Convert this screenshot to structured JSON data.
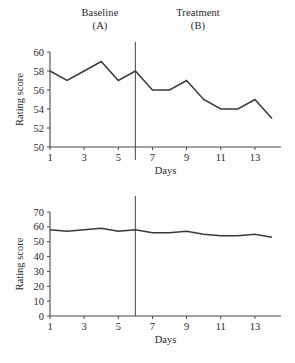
{
  "phases": [
    {
      "name": "Baseline",
      "code": "(A)"
    },
    {
      "name": "Treatment",
      "code": "(B)"
    }
  ],
  "chart_data": [
    {
      "type": "line",
      "panel": "top",
      "title": "",
      "xlabel": "Days",
      "ylabel": "Rating score",
      "x": [
        1,
        2,
        3,
        4,
        5,
        6,
        7,
        8,
        9,
        10,
        11,
        12,
        13,
        14
      ],
      "values": [
        58,
        57,
        58,
        59,
        57,
        58,
        56,
        56,
        57,
        55,
        54,
        54,
        55,
        53
      ],
      "xticks": [
        1,
        3,
        5,
        7,
        9,
        11,
        13
      ],
      "yticks": [
        50,
        52,
        54,
        56,
        58,
        60
      ],
      "xlim": [
        1,
        14
      ],
      "ylim": [
        50,
        60
      ],
      "grid": false,
      "legend": "none",
      "phase_divider_x": 6,
      "series": [
        {
          "name": "Rating score",
          "values": [
            58,
            57,
            58,
            59,
            57,
            58,
            56,
            56,
            57,
            55,
            54,
            54,
            55,
            53
          ]
        }
      ]
    },
    {
      "type": "line",
      "panel": "bottom",
      "title": "",
      "xlabel": "Days",
      "ylabel": "Rating score",
      "x": [
        1,
        2,
        3,
        4,
        5,
        6,
        7,
        8,
        9,
        10,
        11,
        12,
        13,
        14
      ],
      "values": [
        58,
        57,
        58,
        59,
        57,
        58,
        56,
        56,
        57,
        55,
        54,
        54,
        55,
        53
      ],
      "xticks": [
        1,
        3,
        5,
        7,
        9,
        11,
        13
      ],
      "yticks": [
        0,
        10,
        20,
        30,
        40,
        50,
        60,
        70
      ],
      "xlim": [
        1,
        14
      ],
      "ylim": [
        0,
        70
      ],
      "grid": false,
      "legend": "none",
      "phase_divider_x": 6,
      "series": [
        {
          "name": "Rating score",
          "values": [
            58,
            57,
            58,
            59,
            57,
            58,
            56,
            56,
            57,
            55,
            54,
            54,
            55,
            53
          ]
        }
      ]
    }
  ],
  "colors": {
    "line": "#3a3a3a",
    "axis": "#4a4a4a",
    "divider": "#555555",
    "background": "#fdfdfd"
  }
}
